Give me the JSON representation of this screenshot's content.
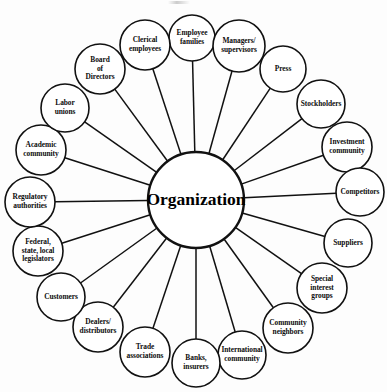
{
  "diagram": {
    "hub": {
      "label": "Organization",
      "cx": 196,
      "cy": 200,
      "r": 48
    },
    "stroke_color": "#111111",
    "fill_color": "#ffffff",
    "background_color": "#fdfdfd",
    "node_count": 18,
    "nodes": [
      {
        "id": "employee-families",
        "lines": [
          "Employee",
          "families"
        ],
        "cx": 192,
        "cy": 38,
        "r": 23
      },
      {
        "id": "managers-supervisors",
        "lines": [
          "Managers/",
          "supervisors"
        ],
        "cx": 239,
        "cy": 46,
        "r": 26
      },
      {
        "id": "press",
        "lines": [
          "Press"
        ],
        "cx": 283,
        "cy": 69,
        "r": 23
      },
      {
        "id": "stockholders",
        "lines": [
          "Stockholders"
        ],
        "cx": 321,
        "cy": 104,
        "r": 24
      },
      {
        "id": "investment-community",
        "lines": [
          "Investment",
          "community"
        ],
        "cx": 347,
        "cy": 147,
        "r": 25
      },
      {
        "id": "competitors",
        "lines": [
          "Competitors"
        ],
        "cx": 360,
        "cy": 192,
        "r": 24
      },
      {
        "id": "suppliers",
        "lines": [
          "Suppliers"
        ],
        "cx": 348,
        "cy": 243,
        "r": 24
      },
      {
        "id": "special-interest-groups",
        "lines": [
          "Special",
          "interest",
          "groups"
        ],
        "cx": 322,
        "cy": 288,
        "r": 25
      },
      {
        "id": "community-neighbors",
        "lines": [
          "Community",
          "neighbors"
        ],
        "cx": 288,
        "cy": 328,
        "r": 25
      },
      {
        "id": "international-community",
        "lines": [
          "International",
          "community"
        ],
        "cx": 242,
        "cy": 355,
        "r": 24
      },
      {
        "id": "banks-insurers",
        "lines": [
          "Banks,",
          "insurers"
        ],
        "cx": 196,
        "cy": 363,
        "r": 24
      },
      {
        "id": "trade-associations",
        "lines": [
          "Trade",
          "associations"
        ],
        "cx": 145,
        "cy": 352,
        "r": 25
      },
      {
        "id": "dealers-distributors",
        "lines": [
          "Dealers/",
          "distributors"
        ],
        "cx": 98,
        "cy": 327,
        "r": 25
      },
      {
        "id": "customers",
        "lines": [
          "Customers"
        ],
        "cx": 61,
        "cy": 297,
        "r": 24
      },
      {
        "id": "federal-state-local-legislators",
        "lines": [
          "Federal,",
          "state, local",
          "legislators"
        ],
        "cx": 38,
        "cy": 251,
        "r": 25
      },
      {
        "id": "regulatory-authorities",
        "lines": [
          "Regulatory",
          "authorities"
        ],
        "cx": 30,
        "cy": 202,
        "r": 25
      },
      {
        "id": "academic-community",
        "lines": [
          "Academic",
          "community"
        ],
        "cx": 41,
        "cy": 150,
        "r": 25
      },
      {
        "id": "labor-unions",
        "lines": [
          "Labor",
          "unions"
        ],
        "cx": 65,
        "cy": 108,
        "r": 24
      },
      {
        "id": "board-of-directors",
        "lines": [
          "Board",
          "of",
          "Directors"
        ],
        "cx": 100,
        "cy": 69,
        "r": 25
      },
      {
        "id": "clerical-employees",
        "lines": [
          "Clerical",
          "employees"
        ],
        "cx": 145,
        "cy": 45,
        "r": 25
      }
    ]
  }
}
